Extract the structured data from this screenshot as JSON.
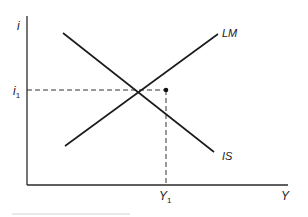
{
  "diagram": {
    "axes": {
      "y_label": "i",
      "x_label": "Y"
    },
    "curves": [
      {
        "name": "LM",
        "label": "LM",
        "slope": "upward"
      },
      {
        "name": "IS",
        "label": "IS",
        "slope": "downward"
      }
    ],
    "equilibrium": {
      "i_label": "i",
      "i_sub": "1",
      "y_label": "Y",
      "y_sub": "1"
    },
    "colors": {
      "line": "#1a1a1a",
      "dashed": "#333333",
      "footer_rule": "#cfcfcf"
    }
  }
}
